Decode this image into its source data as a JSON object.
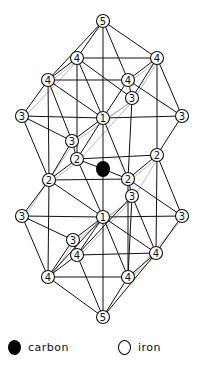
{
  "figure": {
    "colors": {
      "line": "#111111",
      "faint_line": "#9a9a9a",
      "carbon": "#000000",
      "iron_fill": "#ffffff"
    },
    "carbon": {
      "id": "C",
      "x": 103,
      "y": 169,
      "r": 7
    },
    "nodes": [
      {
        "id": "n5t",
        "label": "5",
        "x": 103,
        "y": 21
      },
      {
        "id": "n4a",
        "label": "4",
        "x": 77,
        "y": 58
      },
      {
        "id": "n4b",
        "label": "4",
        "x": 157,
        "y": 58
      },
      {
        "id": "n4c",
        "label": "4",
        "x": 48,
        "y": 80
      },
      {
        "id": "n4d",
        "label": "4",
        "x": 128,
        "y": 80
      },
      {
        "id": "n3a",
        "label": "3",
        "x": 132,
        "y": 98
      },
      {
        "id": "n3b",
        "label": "3",
        "x": 22,
        "y": 116
      },
      {
        "id": "n3c",
        "label": "3",
        "x": 182,
        "y": 116
      },
      {
        "id": "n1t",
        "label": "1",
        "x": 103,
        "y": 118
      },
      {
        "id": "n3d",
        "label": "3",
        "x": 72,
        "y": 141
      },
      {
        "id": "n2a",
        "label": "2",
        "x": 77,
        "y": 159
      },
      {
        "id": "n2b",
        "label": "2",
        "x": 157,
        "y": 155
      },
      {
        "id": "n2c",
        "label": "2",
        "x": 49,
        "y": 180
      },
      {
        "id": "n2d",
        "label": "2",
        "x": 128,
        "y": 179
      },
      {
        "id": "n3e",
        "label": "3",
        "x": 132,
        "y": 196
      },
      {
        "id": "n3f",
        "label": "3",
        "x": 22,
        "y": 216
      },
      {
        "id": "n3g",
        "label": "3",
        "x": 182,
        "y": 216
      },
      {
        "id": "n1b",
        "label": "1",
        "x": 103,
        "y": 217
      },
      {
        "id": "n3h",
        "label": "3",
        "x": 73,
        "y": 240
      },
      {
        "id": "n4e",
        "label": "4",
        "x": 77,
        "y": 255
      },
      {
        "id": "n4f",
        "label": "4",
        "x": 156,
        "y": 253
      },
      {
        "id": "n4g",
        "label": "4",
        "x": 48,
        "y": 277
      },
      {
        "id": "n4h",
        "label": "4",
        "x": 128,
        "y": 277
      },
      {
        "id": "n5b",
        "label": "5",
        "x": 103,
        "y": 317
      }
    ],
    "edges": [
      [
        "n5t",
        "n4a"
      ],
      [
        "n5t",
        "n4b"
      ],
      [
        "n5t",
        "n4c"
      ],
      [
        "n5t",
        "n4d"
      ],
      [
        "n5t",
        "n1t"
      ],
      [
        "n4a",
        "n4b"
      ],
      [
        "n4c",
        "n4d"
      ],
      [
        "n4a",
        "n4c"
      ],
      [
        "n4b",
        "n4d"
      ],
      [
        "n4a",
        "n1t"
      ],
      [
        "n4a",
        "n2a"
      ],
      [
        "n4a",
        "n3a"
      ],
      [
        "n4b",
        "n3c"
      ],
      [
        "n4b",
        "n2b"
      ],
      [
        "n4b",
        "n3a"
      ],
      [
        "n4c",
        "n1t"
      ],
      [
        "n4c",
        "n3b"
      ],
      [
        "n4c",
        "n2c"
      ],
      [
        "n4c",
        "n3d"
      ],
      [
        "n4d",
        "n1t"
      ],
      [
        "n4d",
        "n3c"
      ],
      [
        "n4d",
        "n3a"
      ],
      [
        "n3a",
        "n2d"
      ],
      [
        "n3b",
        "n2c"
      ],
      [
        "n3b",
        "n3d"
      ],
      [
        "n3c",
        "n2b"
      ],
      [
        "n1t",
        "n3c"
      ],
      [
        "n1t",
        "n2a"
      ],
      [
        "n1t",
        "n2d"
      ],
      [
        "n1t",
        "C"
      ],
      [
        "n1t",
        "n3d"
      ],
      [
        "n3b",
        "n1t"
      ],
      [
        "n3d",
        "n2a"
      ],
      [
        "n3d",
        "n2c"
      ],
      [
        "n2a",
        "n2b"
      ],
      [
        "n2a",
        "n2c"
      ],
      [
        "n2a",
        "C"
      ],
      [
        "n2a",
        "n1b"
      ],
      [
        "n2c",
        "n2d"
      ],
      [
        "n2c",
        "n3f"
      ],
      [
        "n2c",
        "n1b"
      ],
      [
        "n2c",
        "n4g"
      ],
      [
        "n2b",
        "n2d"
      ],
      [
        "n2b",
        "n3g"
      ],
      [
        "n2b",
        "n4f"
      ],
      [
        "C",
        "n2d"
      ],
      [
        "C",
        "n1b"
      ],
      [
        "n2d",
        "n3e"
      ],
      [
        "n2d",
        "n4h"
      ],
      [
        "n2d",
        "n3g"
      ],
      [
        "n3e",
        "n4h"
      ],
      [
        "n3e",
        "n4f"
      ],
      [
        "n3e",
        "n4e"
      ],
      [
        "n3f",
        "n3h"
      ],
      [
        "n3f",
        "n4g"
      ],
      [
        "n3f",
        "n1b"
      ],
      [
        "n3g",
        "n4f"
      ],
      [
        "n3g",
        "n1b"
      ],
      [
        "n1b",
        "n3h"
      ],
      [
        "n1b",
        "n4e"
      ],
      [
        "n1b",
        "n4f"
      ],
      [
        "n1b",
        "n4g"
      ],
      [
        "n1b",
        "n4h"
      ],
      [
        "n1b",
        "n5b"
      ],
      [
        "n3h",
        "n4e"
      ],
      [
        "n3h",
        "n4g"
      ],
      [
        "n4e",
        "n4f"
      ],
      [
        "n4g",
        "n4h"
      ],
      [
        "n4e",
        "n4g"
      ],
      [
        "n4f",
        "n4h"
      ],
      [
        "n4e",
        "n5b"
      ],
      [
        "n4f",
        "n5b"
      ],
      [
        "n4g",
        "n5b"
      ],
      [
        "n4h",
        "n5b"
      ]
    ],
    "faint_edges": [
      [
        "n4c",
        "n4a"
      ],
      [
        "n3b",
        "n4a"
      ],
      [
        "n3d",
        "n3a"
      ],
      [
        "n2a",
        "n3a"
      ],
      [
        "n2c",
        "n2a"
      ],
      [
        "n3f",
        "n3d"
      ],
      [
        "n4g",
        "n3h"
      ],
      [
        "n3h",
        "n3e"
      ],
      [
        "n4e",
        "n3e"
      ],
      [
        "n4h",
        "n4f"
      ],
      [
        "n2d",
        "n2b"
      ],
      [
        "n3e",
        "n2b"
      ],
      [
        "n4h",
        "n3g"
      ],
      [
        "n3a",
        "n4b"
      ],
      [
        "n4d",
        "n4b"
      ],
      [
        "n1t",
        "n3a"
      ],
      [
        "n1b",
        "n3e"
      ]
    ]
  },
  "legend": {
    "carbon_label": "carbon",
    "iron_label": "iron"
  }
}
